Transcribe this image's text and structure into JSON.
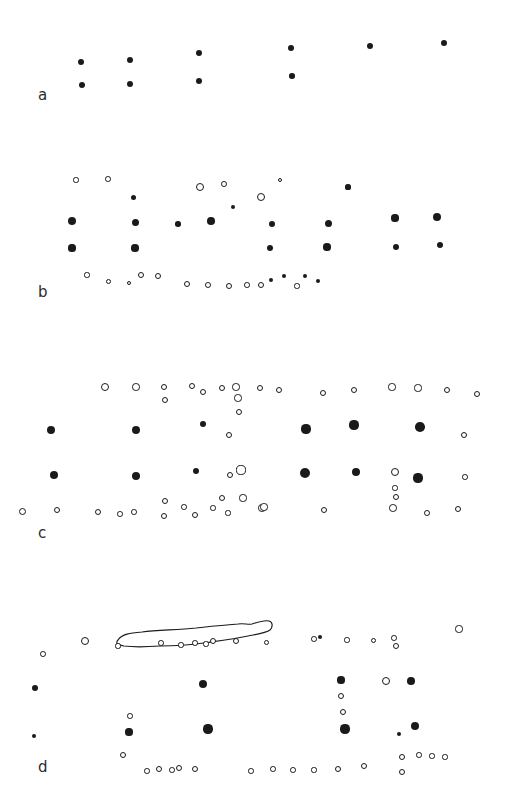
{
  "figure": {
    "width": 512,
    "height": 802,
    "background_color": "#ffffff",
    "marker_colors": {
      "filled": "#1a1a1a",
      "open_stroke": "#1a1a1a",
      "open_fill": "#ffffff",
      "label_color": "#2b2b2b",
      "outline_stroke": "#1a1a1a"
    }
  },
  "chart_data": {
    "type": "scatter",
    "xlabel": "",
    "ylabel": "",
    "xlim": [
      0,
      512
    ],
    "ylim": [
      0,
      802
    ],
    "grid": false,
    "legend": null,
    "legend_position": "none",
    "panels": [
      {
        "id": "a",
        "label": "a",
        "label_x": 38,
        "label_y": 88,
        "series": [
          {
            "name": "filled",
            "marker": "filled",
            "points": [
              {
                "x": 81,
                "y": 62,
                "r": 3.0
              },
              {
                "x": 82,
                "y": 85,
                "r": 3.0
              },
              {
                "x": 130,
                "y": 60,
                "r": 3.2
              },
              {
                "x": 130,
                "y": 84,
                "r": 3.2
              },
              {
                "x": 199,
                "y": 53,
                "r": 3.2
              },
              {
                "x": 199,
                "y": 81,
                "r": 3.0
              },
              {
                "x": 291,
                "y": 48,
                "r": 3.4
              },
              {
                "x": 292,
                "y": 76,
                "r": 2.8
              },
              {
                "x": 370,
                "y": 46,
                "r": 3.0
              },
              {
                "x": 444,
                "y": 43,
                "r": 3.2
              }
            ]
          }
        ],
        "outlines": []
      },
      {
        "id": "b",
        "label": "b",
        "label_x": 38,
        "label_y": 285,
        "series": [
          {
            "name": "open",
            "marker": "open",
            "points": [
              {
                "x": 76,
                "y": 180,
                "r": 2.6
              },
              {
                "x": 108,
                "y": 179,
                "r": 2.8
              },
              {
                "x": 200,
                "y": 187,
                "r": 4.2
              },
              {
                "x": 224,
                "y": 184,
                "r": 2.9
              },
              {
                "x": 261,
                "y": 197,
                "r": 4.0
              },
              {
                "x": 280,
                "y": 180,
                "r": 2.3
              },
              {
                "x": 87,
                "y": 275,
                "r": 2.6
              },
              {
                "x": 108,
                "y": 281,
                "r": 2.5
              },
              {
                "x": 129,
                "y": 283,
                "r": 2.4
              },
              {
                "x": 141,
                "y": 275,
                "r": 3.0
              },
              {
                "x": 158,
                "y": 276,
                "r": 3.4
              },
              {
                "x": 187,
                "y": 284,
                "r": 3.0
              },
              {
                "x": 208,
                "y": 285,
                "r": 2.9
              },
              {
                "x": 229,
                "y": 286,
                "r": 3.0
              },
              {
                "x": 247,
                "y": 285,
                "r": 2.8
              },
              {
                "x": 261,
                "y": 285,
                "r": 3.3
              },
              {
                "x": 297,
                "y": 286,
                "r": 2.6
              }
            ]
          },
          {
            "name": "filled",
            "marker": "filled",
            "points": [
              {
                "x": 133,
                "y": 197,
                "r": 2.5
              },
              {
                "x": 233,
                "y": 207,
                "r": 2.4
              },
              {
                "x": 348,
                "y": 187,
                "r": 2.6
              },
              {
                "x": 72,
                "y": 221,
                "r": 4.0
              },
              {
                "x": 135,
                "y": 222,
                "r": 3.5
              },
              {
                "x": 178,
                "y": 224,
                "r": 2.8
              },
              {
                "x": 211,
                "y": 221,
                "r": 3.8
              },
              {
                "x": 272,
                "y": 224,
                "r": 3.3
              },
              {
                "x": 328,
                "y": 223,
                "r": 3.5
              },
              {
                "x": 395,
                "y": 218,
                "r": 3.6
              },
              {
                "x": 437,
                "y": 217,
                "r": 4.2
              },
              {
                "x": 72,
                "y": 248,
                "r": 3.6
              },
              {
                "x": 135,
                "y": 248,
                "r": 3.6
              },
              {
                "x": 270,
                "y": 248,
                "r": 3.2
              },
              {
                "x": 327,
                "y": 247,
                "r": 3.6
              },
              {
                "x": 396,
                "y": 247,
                "r": 3.2
              },
              {
                "x": 440,
                "y": 245,
                "r": 3.2
              },
              {
                "x": 271,
                "y": 280,
                "r": 2.4
              },
              {
                "x": 284,
                "y": 276,
                "r": 2.4
              },
              {
                "x": 305,
                "y": 276,
                "r": 2.4
              },
              {
                "x": 318,
                "y": 281,
                "r": 2.3
              }
            ]
          }
        ],
        "outlines": []
      },
      {
        "id": "c",
        "label": "c",
        "label_x": 38,
        "label_y": 526,
        "series": [
          {
            "name": "open",
            "marker": "open",
            "points": [
              {
                "x": 105,
                "y": 387,
                "r": 4.0
              },
              {
                "x": 136,
                "y": 387,
                "r": 3.8
              },
              {
                "x": 164,
                "y": 387,
                "r": 3.4
              },
              {
                "x": 165,
                "y": 400,
                "r": 3.4
              },
              {
                "x": 192,
                "y": 386,
                "r": 3.3
              },
              {
                "x": 203,
                "y": 392,
                "r": 3.0
              },
              {
                "x": 222,
                "y": 388,
                "r": 3.0
              },
              {
                "x": 236,
                "y": 387,
                "r": 3.7
              },
              {
                "x": 238,
                "y": 398,
                "r": 3.7
              },
              {
                "x": 239,
                "y": 412,
                "r": 3.0
              },
              {
                "x": 260,
                "y": 388,
                "r": 3.2
              },
              {
                "x": 279,
                "y": 390,
                "r": 3.4
              },
              {
                "x": 323,
                "y": 393,
                "r": 3.0
              },
              {
                "x": 354,
                "y": 390,
                "r": 3.2
              },
              {
                "x": 392,
                "y": 387,
                "r": 3.6
              },
              {
                "x": 418,
                "y": 388,
                "r": 3.6
              },
              {
                "x": 447,
                "y": 390,
                "r": 3.2
              },
              {
                "x": 477,
                "y": 394,
                "r": 3.3
              },
              {
                "x": 229,
                "y": 435,
                "r": 3.4
              },
              {
                "x": 464,
                "y": 435,
                "r": 3.3
              },
              {
                "x": 230,
                "y": 475,
                "r": 3.0
              },
              {
                "x": 241,
                "y": 470,
                "r": 4.6
              },
              {
                "x": 395,
                "y": 472,
                "r": 4.2
              },
              {
                "x": 395,
                "y": 488,
                "r": 2.6
              },
              {
                "x": 396,
                "y": 497,
                "r": 3.3
              },
              {
                "x": 465,
                "y": 477,
                "r": 2.8
              },
              {
                "x": 22,
                "y": 511,
                "r": 3.5
              },
              {
                "x": 57,
                "y": 510,
                "r": 3.4
              },
              {
                "x": 98,
                "y": 512,
                "r": 3.0
              },
              {
                "x": 120,
                "y": 514,
                "r": 2.8
              },
              {
                "x": 134,
                "y": 512,
                "r": 2.8
              },
              {
                "x": 165,
                "y": 501,
                "r": 3.0
              },
              {
                "x": 164,
                "y": 516,
                "r": 3.2
              },
              {
                "x": 184,
                "y": 507,
                "r": 2.8
              },
              {
                "x": 195,
                "y": 515,
                "r": 3.0
              },
              {
                "x": 222,
                "y": 498,
                "r": 3.0
              },
              {
                "x": 213,
                "y": 508,
                "r": 2.7
              },
              {
                "x": 228,
                "y": 513,
                "r": 2.6
              },
              {
                "x": 243,
                "y": 498,
                "r": 3.6
              },
              {
                "x": 262,
                "y": 508,
                "r": 3.8
              },
              {
                "x": 324,
                "y": 510,
                "r": 3.2
              },
              {
                "x": 264,
                "y": 507,
                "r": 3.6
              },
              {
                "x": 393,
                "y": 508,
                "r": 3.8
              },
              {
                "x": 427,
                "y": 513,
                "r": 2.9
              },
              {
                "x": 458,
                "y": 509,
                "r": 3.0
              }
            ]
          },
          {
            "name": "filled",
            "marker": "filled",
            "points": [
              {
                "x": 51,
                "y": 430,
                "r": 4.0
              },
              {
                "x": 136,
                "y": 430,
                "r": 4.0
              },
              {
                "x": 203,
                "y": 424,
                "r": 3.2
              },
              {
                "x": 306,
                "y": 429,
                "r": 4.6
              },
              {
                "x": 354,
                "y": 425,
                "r": 4.6
              },
              {
                "x": 420,
                "y": 427,
                "r": 4.8
              },
              {
                "x": 54,
                "y": 475,
                "r": 4.0
              },
              {
                "x": 136,
                "y": 476,
                "r": 4.0
              },
              {
                "x": 196,
                "y": 471,
                "r": 3.4
              },
              {
                "x": 305,
                "y": 473,
                "r": 5.0
              },
              {
                "x": 356,
                "y": 472,
                "r": 4.4
              },
              {
                "x": 418,
                "y": 478,
                "r": 4.6
              }
            ]
          }
        ],
        "outlines": []
      },
      {
        "id": "d",
        "label": "d",
        "label_x": 38,
        "label_y": 760,
        "series": [
          {
            "name": "open",
            "marker": "open",
            "points": [
              {
                "x": 85,
                "y": 641,
                "r": 4.0
              },
              {
                "x": 43,
                "y": 654,
                "r": 2.8
              },
              {
                "x": 118,
                "y": 646,
                "r": 2.6
              },
              {
                "x": 161,
                "y": 643,
                "r": 2.8
              },
              {
                "x": 181,
                "y": 645,
                "r": 2.6
              },
              {
                "x": 195,
                "y": 643,
                "r": 2.8
              },
              {
                "x": 206,
                "y": 644,
                "r": 2.6
              },
              {
                "x": 213,
                "y": 641,
                "r": 3.2
              },
              {
                "x": 236,
                "y": 641,
                "r": 3.0
              },
              {
                "x": 266,
                "y": 642,
                "r": 2.5
              },
              {
                "x": 314,
                "y": 639,
                "r": 2.8
              },
              {
                "x": 347,
                "y": 640,
                "r": 2.6
              },
              {
                "x": 373,
                "y": 640,
                "r": 2.5
              },
              {
                "x": 394,
                "y": 638,
                "r": 2.8
              },
              {
                "x": 396,
                "y": 646,
                "r": 3.0
              },
              {
                "x": 459,
                "y": 629,
                "r": 3.6
              },
              {
                "x": 386,
                "y": 681,
                "r": 4.0
              },
              {
                "x": 341,
                "y": 696,
                "r": 3.4
              },
              {
                "x": 343,
                "y": 712,
                "r": 3.4
              },
              {
                "x": 130,
                "y": 716,
                "r": 2.8
              },
              {
                "x": 123,
                "y": 755,
                "r": 3.4
              },
              {
                "x": 147,
                "y": 771,
                "r": 2.8
              },
              {
                "x": 159,
                "y": 769,
                "r": 3.2
              },
              {
                "x": 172,
                "y": 770,
                "r": 2.8
              },
              {
                "x": 179,
                "y": 768,
                "r": 3.0
              },
              {
                "x": 195,
                "y": 769,
                "r": 3.2
              },
              {
                "x": 251,
                "y": 771,
                "r": 2.8
              },
              {
                "x": 273,
                "y": 769,
                "r": 2.8
              },
              {
                "x": 293,
                "y": 770,
                "r": 2.8
              },
              {
                "x": 314,
                "y": 770,
                "r": 2.6
              },
              {
                "x": 338,
                "y": 769,
                "r": 3.0
              },
              {
                "x": 364,
                "y": 766,
                "r": 3.2
              },
              {
                "x": 402,
                "y": 757,
                "r": 3.2
              },
              {
                "x": 402,
                "y": 772,
                "r": 3.2
              },
              {
                "x": 419,
                "y": 755,
                "r": 2.8
              },
              {
                "x": 432,
                "y": 756,
                "r": 2.6
              },
              {
                "x": 445,
                "y": 757,
                "r": 2.6
              }
            ]
          },
          {
            "name": "filled",
            "marker": "filled",
            "points": [
              {
                "x": 320,
                "y": 637,
                "r": 2.2
              },
              {
                "x": 35,
                "y": 688,
                "r": 3.0
              },
              {
                "x": 203,
                "y": 684,
                "r": 4.4
              },
              {
                "x": 341,
                "y": 680,
                "r": 3.6
              },
              {
                "x": 411,
                "y": 681,
                "r": 3.8
              },
              {
                "x": 34,
                "y": 736,
                "r": 2.4
              },
              {
                "x": 129,
                "y": 732,
                "r": 3.6
              },
              {
                "x": 208,
                "y": 729,
                "r": 4.6
              },
              {
                "x": 345,
                "y": 729,
                "r": 4.6
              },
              {
                "x": 415,
                "y": 726,
                "r": 4.4
              },
              {
                "x": 399,
                "y": 734,
                "r": 2.3
              }
            ]
          }
        ],
        "outlines": [
          {
            "name": "elongated-outline-annotation",
            "path": "M 118 640 C 122 634 130 633 142 632 C 158 630 176 630 196 628 C 212 626 226 625 238 624 C 244 623 248 625 252 624 C 258 622 264 620 269 621 C 273 622 273 627 270 630 C 266 633 258 634 248 636 C 234 639 218 641 204 643 C 190 645 174 646 160 646 C 146 647 132 647 124 646 C 118 645 115 643 118 640 Z"
          }
        ]
      }
    ]
  }
}
